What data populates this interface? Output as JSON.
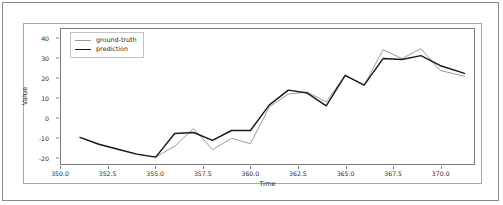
{
  "chart_data": {
    "type": "line",
    "title": "",
    "xlabel": "Time",
    "ylabel": "Value",
    "xlim": [
      350.0,
      371.8
    ],
    "ylim": [
      -23.5,
      45.0
    ],
    "xticks": [
      "350.0",
      "352.5",
      "355.0",
      "357.5",
      "360.0",
      "362.5",
      "365.0",
      "367.5",
      "370.0"
    ],
    "xtick_values": [
      350.0,
      352.5,
      355.0,
      357.5,
      360.0,
      362.5,
      365.0,
      367.5,
      370.0
    ],
    "yticks": [
      "-20",
      "-10",
      "0",
      "10",
      "20",
      "30",
      "40"
    ],
    "ytick_values": [
      -20,
      -10,
      0,
      10,
      20,
      30,
      40
    ],
    "grid": false,
    "legend_position": "upper left",
    "x": [
      351.0,
      352.0,
      353.0,
      354.0,
      355.0,
      356.0,
      357.0,
      358.0,
      359.0,
      360.0,
      361.0,
      362.0,
      363.0,
      364.0,
      365.0,
      366.0,
      367.0,
      368.0,
      369.0,
      370.0,
      371.3
    ],
    "series": [
      {
        "name": "ground-truth",
        "color": "#9a9a9a",
        "values": [
          -10.0,
          -13.5,
          -16.0,
          -18.5,
          -20.0,
          -14.5,
          -5.5,
          -16.2,
          -10.5,
          -13.2,
          5.5,
          12.0,
          13.0,
          8.0,
          21.5,
          16.5,
          34.5,
          30.0,
          35.0,
          24.0,
          21.0
        ]
      },
      {
        "name": "prediction",
        "color": "#1a1a1a",
        "values": [
          -10.0,
          -13.5,
          -16.0,
          -18.5,
          -20.0,
          -8.0,
          -7.5,
          -11.5,
          -6.5,
          -6.5,
          6.5,
          14.0,
          12.5,
          6.0,
          21.5,
          16.5,
          30.0,
          29.5,
          31.5,
          26.5,
          22.5
        ]
      }
    ]
  },
  "legend": {
    "items": [
      {
        "label": "ground-truth"
      },
      {
        "label": "prediction"
      }
    ]
  }
}
